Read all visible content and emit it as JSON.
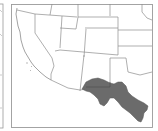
{
  "map": {
    "region": "Southwestern United States and northern Mexico",
    "left_panel": {
      "visible_edge_only": true
    },
    "main_panel": {
      "range_fill_color": "#6b6b6b",
      "border_color": "#9a9a9a",
      "state_line_color": "#8c8c8c",
      "background": "#ffffff",
      "highlighted_region": "shaded species range along US-Mexico border (southern New Mexico / west Texas into Chihuahua / Coahuila)"
    }
  }
}
